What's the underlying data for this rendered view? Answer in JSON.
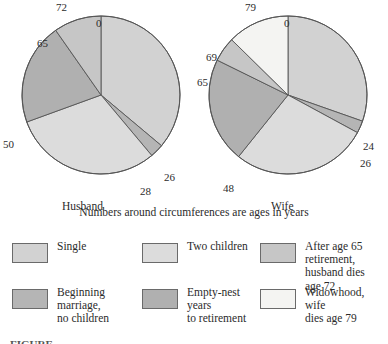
{
  "figure": {
    "note": "Numbers around circumferences are ages in years",
    "caption_partial": "FIGURE"
  },
  "colors": {
    "single": "#d2d2d2",
    "beginning_marriage": "#b5b5b5",
    "two_children": "#dcdcdc",
    "empty_nest": "#b0b0b0",
    "retirement": "#c6c6c6",
    "widowhood": "#f4f4f2",
    "outline": "#555555",
    "text": "#2b2b2b"
  },
  "legend": {
    "items": [
      {
        "label": "Single",
        "color_key": "single",
        "swatch": "#d2d2d2"
      },
      {
        "label": "Two children",
        "color_key": "two_children",
        "swatch": "#dcdcdc"
      },
      {
        "label": "After age 65\nretirement,\nhusband dies age 72",
        "color_key": "retirement",
        "swatch": "#c6c6c6"
      },
      {
        "label": "Beginning\nmarriage,\nno children",
        "color_key": "beginning_marriage",
        "swatch": "#b5b5b5"
      },
      {
        "label": "Empty-nest years\nto retirement",
        "color_key": "empty_nest",
        "swatch": "#b0b0b0"
      },
      {
        "label": "Widowhood, wife\ndies age 79",
        "color_key": "widowhood",
        "swatch": "#f4f4f2"
      }
    ]
  },
  "chart_data": [
    {
      "type": "pie",
      "title": "Husband",
      "subject": "Husband",
      "total_years": 72,
      "start_angle_deg": 0,
      "direction": "clockwise",
      "boundary_ages": [
        0,
        26,
        28,
        50,
        65,
        72
      ],
      "outer_labels": [
        {
          "age": "72",
          "position": "top-outer"
        },
        {
          "age": "0",
          "position": "top-inner"
        },
        {
          "age": "26",
          "position": "lower-right"
        },
        {
          "age": "28",
          "position": "bottom-right"
        },
        {
          "age": "50",
          "position": "left"
        },
        {
          "age": "65",
          "position": "upper-left"
        }
      ],
      "slices": [
        {
          "name": "Single",
          "start_age": 0,
          "end_age": 26,
          "years": 26,
          "percent": 36.1,
          "color": "#d2d2d2"
        },
        {
          "name": "Beginning marriage, no children",
          "start_age": 26,
          "end_age": 28,
          "years": 2,
          "percent": 2.8,
          "color": "#b5b5b5"
        },
        {
          "name": "Two children",
          "start_age": 28,
          "end_age": 50,
          "years": 22,
          "percent": 30.6,
          "color": "#dcdcdc"
        },
        {
          "name": "Empty-nest years to retirement",
          "start_age": 50,
          "end_age": 65,
          "years": 15,
          "percent": 20.8,
          "color": "#b0b0b0"
        },
        {
          "name": "After age 65 retirement, husband dies age 72",
          "start_age": 65,
          "end_age": 72,
          "years": 7,
          "percent": 9.7,
          "color": "#c6c6c6"
        }
      ]
    },
    {
      "type": "pie",
      "title": "Wife",
      "subject": "Wife",
      "total_years": 79,
      "start_angle_deg": 0,
      "direction": "clockwise",
      "boundary_ages": [
        0,
        24,
        26,
        48,
        65,
        69,
        79
      ],
      "outer_labels": [
        {
          "age": "79",
          "position": "top-outer"
        },
        {
          "age": "0",
          "position": "top-inner"
        },
        {
          "age": "24",
          "position": "right"
        },
        {
          "age": "26",
          "position": "lower-right"
        },
        {
          "age": "48",
          "position": "bottom-left"
        },
        {
          "age": "65",
          "position": "left"
        },
        {
          "age": "69",
          "position": "upper-left"
        }
      ],
      "slices": [
        {
          "name": "Single",
          "start_age": 0,
          "end_age": 24,
          "years": 24,
          "percent": 30.4,
          "color": "#d2d2d2"
        },
        {
          "name": "Beginning marriage, no children",
          "start_age": 24,
          "end_age": 26,
          "years": 2,
          "percent": 2.5,
          "color": "#b5b5b5"
        },
        {
          "name": "Two children",
          "start_age": 26,
          "end_age": 48,
          "years": 22,
          "percent": 27.8,
          "color": "#dcdcdc"
        },
        {
          "name": "Empty-nest years to retirement",
          "start_age": 48,
          "end_age": 65,
          "years": 17,
          "percent": 21.5,
          "color": "#b0b0b0"
        },
        {
          "name": "After age 65 retirement",
          "start_age": 65,
          "end_age": 69,
          "years": 4,
          "percent": 5.1,
          "color": "#c6c6c6"
        },
        {
          "name": "Widowhood, wife dies age 79",
          "start_age": 69,
          "end_age": 79,
          "years": 10,
          "percent": 12.7,
          "color": "#f4f4f2"
        }
      ]
    }
  ]
}
